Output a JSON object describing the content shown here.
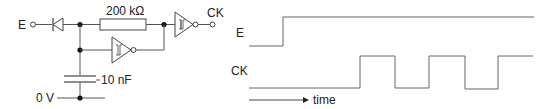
{
  "circuit": {
    "input_label": "E",
    "output_label": "CK",
    "resistor_label": "200 kΩ",
    "capacitor_label": "10 nF",
    "ground_label": "0 V",
    "components": [
      {
        "type": "input-terminal",
        "name": "E"
      },
      {
        "type": "diode",
        "orientation": "cathode toward E"
      },
      {
        "type": "resistor",
        "value": "200 kΩ"
      },
      {
        "type": "schmitt-inverter",
        "role": "feedback"
      },
      {
        "type": "schmitt-inverter",
        "role": "output buffer"
      },
      {
        "type": "capacitor",
        "value": "10 nF"
      },
      {
        "type": "ground-rail",
        "name": "0 V"
      },
      {
        "type": "output-terminal",
        "name": "CK"
      }
    ]
  },
  "timing": {
    "signal_e_label": "E",
    "signal_ck_label": "CK",
    "time_axis_label": "time",
    "signals": [
      {
        "name": "E",
        "description": "low, then steps high and remains high"
      },
      {
        "name": "CK",
        "description": "low after E rises, then oscillates: 3 high pulses (last one stays high at end)"
      }
    ]
  }
}
